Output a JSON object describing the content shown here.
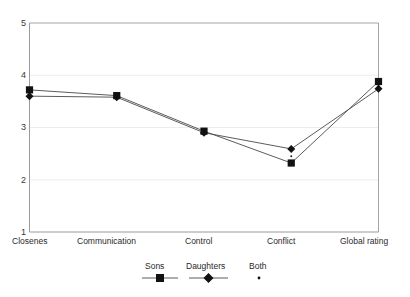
{
  "chart_data": {
    "type": "line",
    "title": "",
    "xlabel": "",
    "ylabel": "",
    "ylim": [
      1,
      5
    ],
    "yticks": [
      1,
      2,
      3,
      4,
      5
    ],
    "grid": true,
    "legend_position": "bottom",
    "categories": [
      "Closenes",
      "Communication",
      "Control",
      "Conflict",
      "Global rating"
    ],
    "series": [
      {
        "name": "Sons",
        "marker": "square",
        "color": "#111111",
        "values": [
          3.72,
          3.61,
          2.93,
          2.32,
          3.88
        ]
      },
      {
        "name": "Daughters",
        "marker": "diamond",
        "color": "#111111",
        "values": [
          3.6,
          3.58,
          2.9,
          2.59,
          3.74
        ]
      },
      {
        "name": "Both",
        "marker": "dot",
        "color": "#111111",
        "values": [
          3.66,
          3.59,
          2.91,
          2.45,
          3.81
        ]
      }
    ]
  },
  "axis": {
    "y_tick_labels": [
      "5",
      "4",
      "3",
      "2",
      "1"
    ],
    "x_tick_labels": [
      "Closenes",
      "Communication",
      "Control",
      "Conflict",
      "Global rating"
    ]
  },
  "legend": {
    "items": [
      {
        "label": "Sons",
        "key": "square-marker-key"
      },
      {
        "label": "Daughters",
        "key": "diamond-marker-key"
      },
      {
        "label": "Both",
        "key": "dot-marker-key"
      }
    ]
  },
  "colors": {
    "line": "#4a4a4a",
    "marker": "#111111",
    "grid": "#e8e8e8",
    "axis": "#9a9a9a",
    "background": "#ffffff"
  }
}
